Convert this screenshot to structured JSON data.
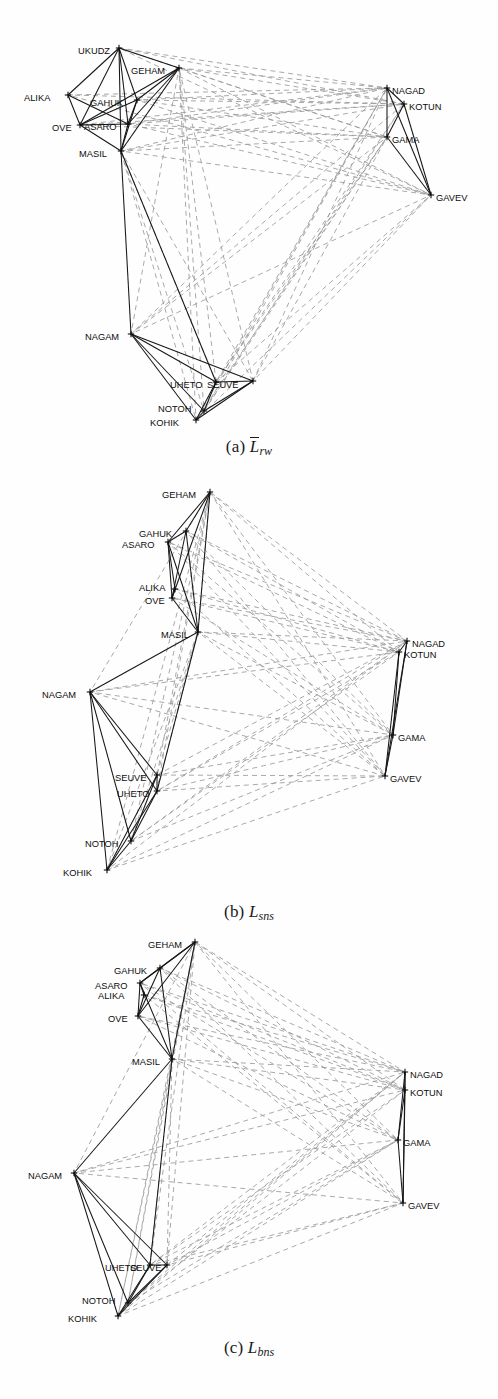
{
  "figure": {
    "kind": "multi-panel-network-figure",
    "width": 498,
    "height": 1399,
    "colors": {
      "background": "#ffffff",
      "positive_edge": "#161616",
      "negative_edge": "#9a9a9a",
      "node_marker": "#0d0d0d",
      "label_text": "#0d0d0d",
      "caption_text": "#1a1a1a"
    },
    "edge_legend": {
      "positive": "solid dark line",
      "negative": "dashed grey line"
    }
  },
  "captions": {
    "a": {
      "label": "(a)",
      "symbol": "L",
      "overbar": true,
      "subscript": "rw",
      "full": "(a) L̄rw"
    },
    "b": {
      "label": "(b)",
      "symbol": "L",
      "overbar": false,
      "subscript": "sns",
      "full": "(b) Lsns"
    },
    "c": {
      "label": "(c)",
      "symbol": "L",
      "overbar": false,
      "subscript": "bns",
      "full": "(c) Lbns"
    }
  },
  "nodes": [
    "UKUDZ",
    "GEHAM",
    "ALIKA",
    "GAHUK",
    "OVE",
    "ASARO",
    "MASIL",
    "NAGAM",
    "UHETO",
    "SEUVE",
    "NOTOH",
    "KOHIK",
    "NAGAD",
    "KOTUN",
    "GAMA",
    "GAVEV"
  ],
  "chart_data": {
    "type": "scatter",
    "title": "",
    "panels": [
      {
        "id": "a",
        "caption": "(a) L̄rw",
        "nodes": [
          {
            "name": "UKUDZ",
            "x": 119,
            "y": 48,
            "label_x": 78,
            "label_y": 51,
            "anchor": "start"
          },
          {
            "name": "GEHAM",
            "x": 179,
            "y": 68,
            "label_x": 131,
            "label_y": 71,
            "anchor": "start"
          },
          {
            "name": "ALIKA",
            "x": 68,
            "y": 95,
            "label_x": 24,
            "label_y": 98,
            "anchor": "start"
          },
          {
            "name": "GAHUK",
            "x": 137,
            "y": 100,
            "label_x": 90,
            "label_y": 103,
            "anchor": "start"
          },
          {
            "name": "OVE",
            "x": 80,
            "y": 125,
            "label_x": 52,
            "label_y": 128,
            "anchor": "start"
          },
          {
            "name": "ASARO",
            "x": 128,
            "y": 124,
            "label_x": 84,
            "label_y": 127,
            "anchor": "start"
          },
          {
            "name": "MASIL",
            "x": 121,
            "y": 151,
            "label_x": 79,
            "label_y": 154,
            "anchor": "start"
          },
          {
            "name": "NAGAM",
            "x": 131,
            "y": 334,
            "label_x": 85,
            "label_y": 337,
            "anchor": "start"
          },
          {
            "name": "UHETO",
            "x": 216,
            "y": 382,
            "label_x": 170,
            "label_y": 385,
            "anchor": "start"
          },
          {
            "name": "SEUVE",
            "x": 253,
            "y": 381,
            "label_x": 207,
            "label_y": 385,
            "anchor": "start"
          },
          {
            "name": "NOTOH",
            "x": 204,
            "y": 411,
            "label_x": 158,
            "label_y": 409,
            "anchor": "start"
          },
          {
            "name": "KOHIK",
            "x": 196,
            "y": 420,
            "label_x": 150,
            "label_y": 423,
            "anchor": "start"
          },
          {
            "name": "NAGAD",
            "x": 387,
            "y": 88,
            "label_x": 392,
            "label_y": 91,
            "anchor": "start"
          },
          {
            "name": "KOTUN",
            "x": 404,
            "y": 104,
            "label_x": 409,
            "label_y": 107,
            "anchor": "start"
          },
          {
            "name": "GAMA",
            "x": 387,
            "y": 137,
            "label_x": 392,
            "label_y": 140,
            "anchor": "start"
          },
          {
            "name": "GAVEV",
            "x": 431,
            "y": 195,
            "label_x": 436,
            "label_y": 198,
            "anchor": "start"
          }
        ]
      },
      {
        "id": "b",
        "caption": "(b) Lsns",
        "nodes": [
          {
            "name": "GEHAM",
            "x": 210,
            "y": 492,
            "label_x": 162,
            "label_y": 495,
            "anchor": "start"
          },
          {
            "name": "GAHUK",
            "x": 186,
            "y": 531,
            "label_x": 139,
            "label_y": 534,
            "anchor": "start"
          },
          {
            "name": "ASARO",
            "x": 168,
            "y": 542,
            "label_x": 122,
            "label_y": 545,
            "anchor": "start"
          },
          {
            "name": "ALIKA",
            "x": 175,
            "y": 589,
            "label_x": 139,
            "label_y": 588,
            "anchor": "start"
          },
          {
            "name": "OVE",
            "x": 172,
            "y": 598,
            "label_x": 145,
            "label_y": 601,
            "anchor": "start"
          },
          {
            "name": "MASIL",
            "x": 198,
            "y": 632,
            "label_x": 161,
            "label_y": 635,
            "anchor": "start"
          },
          {
            "name": "NAGAM",
            "x": 90,
            "y": 692,
            "label_x": 42,
            "label_y": 695,
            "anchor": "start"
          },
          {
            "name": "SEUVE",
            "x": 157,
            "y": 775,
            "label_x": 115,
            "label_y": 778,
            "anchor": "start"
          },
          {
            "name": "UHETO",
            "x": 157,
            "y": 791,
            "label_x": 117,
            "label_y": 794,
            "anchor": "start"
          },
          {
            "name": "NOTOH",
            "x": 131,
            "y": 841,
            "label_x": 85,
            "label_y": 844,
            "anchor": "start"
          },
          {
            "name": "KOHIK",
            "x": 107,
            "y": 870,
            "label_x": 63,
            "label_y": 873,
            "anchor": "start"
          },
          {
            "name": "NAGAD",
            "x": 407,
            "y": 641,
            "label_x": 412,
            "label_y": 644,
            "anchor": "start"
          },
          {
            "name": "KOTUN",
            "x": 399,
            "y": 652,
            "label_x": 404,
            "label_y": 655,
            "anchor": "start"
          },
          {
            "name": "GAMA",
            "x": 393,
            "y": 735,
            "label_x": 398,
            "label_y": 738,
            "anchor": "start"
          },
          {
            "name": "GAVEV",
            "x": 385,
            "y": 776,
            "label_x": 390,
            "label_y": 779,
            "anchor": "start"
          }
        ]
      },
      {
        "id": "c",
        "caption": "(c) Lbns",
        "nodes": [
          {
            "name": "GEHAM",
            "x": 195,
            "y": 942,
            "label_x": 148,
            "label_y": 945,
            "anchor": "start"
          },
          {
            "name": "GAHUK",
            "x": 160,
            "y": 968,
            "label_x": 114,
            "label_y": 971,
            "anchor": "start"
          },
          {
            "name": "ASARO",
            "x": 140,
            "y": 983,
            "label_x": 95,
            "label_y": 986,
            "anchor": "start"
          },
          {
            "name": "ALIKA",
            "x": 144,
            "y": 995,
            "label_x": 98,
            "label_y": 996,
            "anchor": "start"
          },
          {
            "name": "OVE",
            "x": 138,
            "y": 1016,
            "label_x": 108,
            "label_y": 1019,
            "anchor": "start"
          },
          {
            "name": "MASIL",
            "x": 172,
            "y": 1059,
            "label_x": 132,
            "label_y": 1062,
            "anchor": "start"
          },
          {
            "name": "NAGAM",
            "x": 74,
            "y": 1173,
            "label_x": 28,
            "label_y": 1176,
            "anchor": "start"
          },
          {
            "name": "UHETO",
            "x": 150,
            "y": 1265,
            "label_x": 105,
            "label_y": 1268,
            "anchor": "start"
          },
          {
            "name": "SEUVE",
            "x": 167,
            "y": 1265,
            "label_x": 130,
            "label_y": 1268,
            "anchor": "start"
          },
          {
            "name": "NOTOH",
            "x": 128,
            "y": 1303,
            "label_x": 82,
            "label_y": 1301,
            "anchor": "start"
          },
          {
            "name": "KOHIK",
            "x": 118,
            "y": 1316,
            "label_x": 68,
            "label_y": 1319,
            "anchor": "start"
          },
          {
            "name": "NAGAD",
            "x": 405,
            "y": 1072,
            "label_x": 410,
            "label_y": 1075,
            "anchor": "start"
          },
          {
            "name": "KOTUN",
            "x": 405,
            "y": 1090,
            "label_x": 410,
            "label_y": 1093,
            "anchor": "start"
          },
          {
            "name": "GAMA",
            "x": 398,
            "y": 1140,
            "label_x": 403,
            "label_y": 1143,
            "anchor": "start"
          },
          {
            "name": "GAVEV",
            "x": 403,
            "y": 1203,
            "label_x": 408,
            "label_y": 1206,
            "anchor": "start"
          }
        ]
      }
    ],
    "positive_edges": [
      [
        "UKUDZ",
        "GEHAM"
      ],
      [
        "UKUDZ",
        "ALIKA"
      ],
      [
        "UKUDZ",
        "GAHUK"
      ],
      [
        "UKUDZ",
        "ASARO"
      ],
      [
        "UKUDZ",
        "OVE"
      ],
      [
        "UKUDZ",
        "MASIL"
      ],
      [
        "GEHAM",
        "GAHUK"
      ],
      [
        "GEHAM",
        "ASARO"
      ],
      [
        "GEHAM",
        "MASIL"
      ],
      [
        "GEHAM",
        "OVE"
      ],
      [
        "GAHUK",
        "ASARO"
      ],
      [
        "GAHUK",
        "MASIL"
      ],
      [
        "GAHUK",
        "OVE"
      ],
      [
        "ASARO",
        "MASIL"
      ],
      [
        "ASARO",
        "OVE"
      ],
      [
        "ALIKA",
        "OVE"
      ],
      [
        "ALIKA",
        "ASARO"
      ],
      [
        "OVE",
        "MASIL"
      ],
      [
        "MASIL",
        "NAGAM"
      ],
      [
        "MASIL",
        "UHETO"
      ],
      [
        "NAGAM",
        "UHETO"
      ],
      [
        "NAGAM",
        "SEUVE"
      ],
      [
        "NAGAM",
        "KOHIK"
      ],
      [
        "NAGAM",
        "NOTOH"
      ],
      [
        "UHETO",
        "SEUVE"
      ],
      [
        "UHETO",
        "NOTOH"
      ],
      [
        "UHETO",
        "KOHIK"
      ],
      [
        "SEUVE",
        "NOTOH"
      ],
      [
        "SEUVE",
        "KOHIK"
      ],
      [
        "NOTOH",
        "KOHIK"
      ],
      [
        "NAGAD",
        "KOTUN"
      ],
      [
        "NAGAD",
        "GAMA"
      ],
      [
        "NAGAD",
        "GAVEV"
      ],
      [
        "KOTUN",
        "GAMA"
      ],
      [
        "KOTUN",
        "GAVEV"
      ],
      [
        "GAMA",
        "GAVEV"
      ]
    ],
    "negative_edges": [
      [
        "UKUDZ",
        "NAGAD"
      ],
      [
        "UKUDZ",
        "KOTUN"
      ],
      [
        "UKUDZ",
        "GAMA"
      ],
      [
        "UKUDZ",
        "GAVEV"
      ],
      [
        "GEHAM",
        "NAGAD"
      ],
      [
        "GEHAM",
        "KOTUN"
      ],
      [
        "GEHAM",
        "GAMA"
      ],
      [
        "GEHAM",
        "GAVEV"
      ],
      [
        "GEHAM",
        "NAGAM"
      ],
      [
        "GEHAM",
        "UHETO"
      ],
      [
        "GEHAM",
        "SEUVE"
      ],
      [
        "GEHAM",
        "NOTOH"
      ],
      [
        "GEHAM",
        "KOHIK"
      ],
      [
        "GAHUK",
        "NAGAD"
      ],
      [
        "GAHUK",
        "KOTUN"
      ],
      [
        "GAHUK",
        "GAMA"
      ],
      [
        "GAHUK",
        "GAVEV"
      ],
      [
        "ASARO",
        "NAGAD"
      ],
      [
        "ASARO",
        "KOTUN"
      ],
      [
        "ASARO",
        "GAMA"
      ],
      [
        "ASARO",
        "GAVEV"
      ],
      [
        "ALIKA",
        "NAGAD"
      ],
      [
        "ALIKA",
        "KOTUN"
      ],
      [
        "ALIKA",
        "GAVEV"
      ],
      [
        "OVE",
        "NAGAD"
      ],
      [
        "OVE",
        "KOTUN"
      ],
      [
        "OVE",
        "GAMA"
      ],
      [
        "MASIL",
        "NAGAD"
      ],
      [
        "MASIL",
        "KOTUN"
      ],
      [
        "MASIL",
        "GAMA"
      ],
      [
        "MASIL",
        "GAVEV"
      ],
      [
        "MASIL",
        "NOTOH"
      ],
      [
        "MASIL",
        "KOHIK"
      ],
      [
        "MASIL",
        "SEUVE"
      ],
      [
        "NAGAM",
        "NAGAD"
      ],
      [
        "NAGAM",
        "KOTUN"
      ],
      [
        "NAGAM",
        "GAMA"
      ],
      [
        "NAGAM",
        "GAVEV"
      ],
      [
        "UHETO",
        "NAGAD"
      ],
      [
        "UHETO",
        "KOTUN"
      ],
      [
        "UHETO",
        "GAMA"
      ],
      [
        "UHETO",
        "GAVEV"
      ],
      [
        "SEUVE",
        "NAGAD"
      ],
      [
        "SEUVE",
        "GAMA"
      ],
      [
        "SEUVE",
        "GAVEV"
      ],
      [
        "NOTOH",
        "NAGAD"
      ],
      [
        "NOTOH",
        "KOTUN"
      ],
      [
        "NOTOH",
        "GAMA"
      ],
      [
        "KOHIK",
        "NAGAD"
      ],
      [
        "KOHIK",
        "GAMA"
      ],
      [
        "KOHIK",
        "GAVEV"
      ],
      [
        "MASIL",
        "UHETO"
      ],
      [
        "MASIL",
        "GEHAM"
      ]
    ]
  }
}
